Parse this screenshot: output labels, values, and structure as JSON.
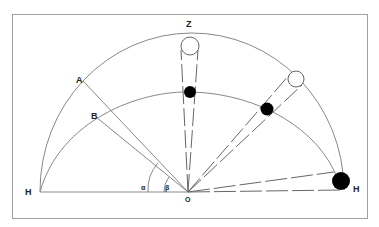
{
  "diagram": {
    "labels": {
      "zenith": "Z",
      "point_a": "A",
      "point_b": "B",
      "horizon_left": "H",
      "horizon_right": "H",
      "origin": "O",
      "angle_alpha": "α",
      "angle_beta": "β"
    },
    "colors": {
      "line": "#777777",
      "frame": "#999999",
      "filled_body": "#000000",
      "hollow_body": "#ffffff"
    },
    "elements": [
      {
        "type": "outer-arc",
        "description": "outer hemisphere arc from H to H through Z"
      },
      {
        "type": "inner-arc",
        "description": "inner arc from H through B"
      },
      {
        "type": "line",
        "from": "O",
        "to": "A"
      },
      {
        "type": "line",
        "from": "O",
        "to": "B"
      },
      {
        "type": "hollow-circle",
        "position": "zenith"
      },
      {
        "type": "filled-circle",
        "position": "below zenith on inner arc"
      },
      {
        "type": "hollow-circle",
        "position": "upper right on outer arc"
      },
      {
        "type": "filled-circle",
        "position": "right on inner arc"
      },
      {
        "type": "filled-circle",
        "position": "horizon right"
      }
    ]
  }
}
